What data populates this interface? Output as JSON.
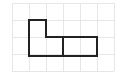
{
  "diagram": {
    "type": "grid-shape",
    "grid": {
      "columns": 6,
      "rows": 4,
      "line_color": "#e6e6e6"
    },
    "shape": {
      "stroke_color": "#222222",
      "description": "L-shaped polyomino outline composed of an upper-left square stacked above a 2-cell bottom row, joined to a 2-cell rectangle on the right; a vertical divider separates the left part from the right rectangle",
      "outline_cells": [
        [
          1,
          1
        ],
        [
          1,
          2
        ],
        [
          2,
          2
        ],
        [
          3,
          2
        ],
        [
          4,
          2
        ]
      ]
    }
  }
}
